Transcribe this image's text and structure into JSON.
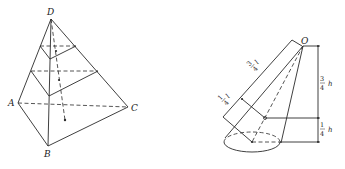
{
  "figure": {
    "left": {
      "title": "Tetrahedron with parallel cross-sections",
      "vertices": {
        "D": "D",
        "A": "A",
        "B": "B",
        "C": "C"
      }
    },
    "right": {
      "title": "Cone with centroid and height partition",
      "apex_label": "O",
      "slant_upper": {
        "num": "3",
        "den": "4",
        "var": "l"
      },
      "slant_lower": {
        "num": "1",
        "den": "4",
        "var": "l"
      },
      "height_upper": {
        "num": "3",
        "den": "4",
        "var": "h"
      },
      "height_lower": {
        "num": "1",
        "den": "4",
        "var": "h"
      }
    }
  },
  "colors": {
    "stroke": "#2a2a2a",
    "background": "#ffffff"
  }
}
